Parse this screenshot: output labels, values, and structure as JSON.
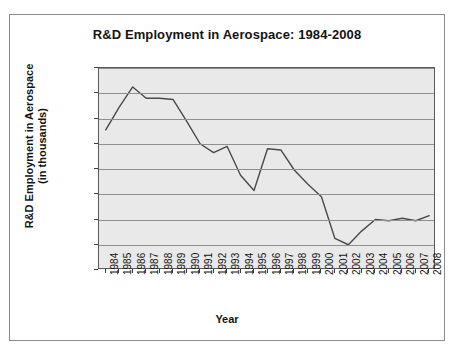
{
  "chart_data": {
    "type": "line",
    "title": "R&D Employment in Aerospace: 1984-2008",
    "xlabel": "Year",
    "ylabel": "R&D Employment in Aerospace\n(in thousands)",
    "ylabel_line1": "R&D Employment in Aerospace",
    "ylabel_line2": "(in thousands)",
    "categories": [
      "1984",
      "1985",
      "1986",
      "1987",
      "1988",
      "1989",
      "1990",
      "1991",
      "1992",
      "1993",
      "1994",
      "1995",
      "1996",
      "1997",
      "1998",
      "1999",
      "2000",
      "2001",
      "2002",
      "2003",
      "2004",
      "2005",
      "2006",
      "2007",
      "2008"
    ],
    "values": [
      111,
      129,
      145,
      136,
      136,
      135,
      118,
      100,
      93,
      98,
      75,
      63,
      96,
      95,
      79,
      68,
      58,
      25,
      20,
      31,
      40,
      39,
      41,
      39,
      43
    ],
    "series": [
      {
        "name": "R&D Employment in Aerospace (in thousands)",
        "values": [
          111,
          129,
          145,
          136,
          136,
          135,
          118,
          100,
          93,
          98,
          75,
          63,
          96,
          95,
          79,
          68,
          58,
          25,
          20,
          31,
          40,
          39,
          41,
          39,
          43
        ]
      }
    ],
    "ylim": [
      0,
      160
    ],
    "y_ticks": [
      0,
      20,
      40,
      60,
      80,
      100,
      120,
      140,
      160
    ],
    "y_tick_labels": [
      "0",
      "20",
      "40",
      "60",
      "80",
      "100",
      "120",
      "140",
      "160"
    ],
    "grid": true,
    "legend": false,
    "line_color": "#4a4a4a",
    "plot_background": "#e9e9e9",
    "gridline_color": "#8f8f8f"
  }
}
